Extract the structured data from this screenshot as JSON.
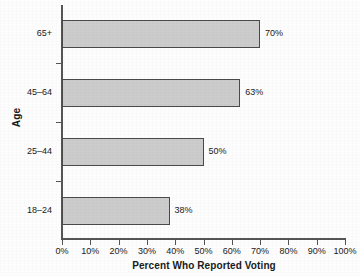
{
  "chart_data": {
    "type": "bar",
    "orientation": "horizontal",
    "title": "",
    "xlabel": "Percent Who Reported Voting",
    "ylabel": "Age",
    "categories": [
      "18–24",
      "25–44",
      "45–64",
      "65+"
    ],
    "values": [
      38,
      50,
      63,
      70
    ],
    "value_labels": [
      "38%",
      "50%",
      "63%",
      "70%"
    ],
    "xlim": [
      0,
      100
    ],
    "xticks": [
      0,
      10,
      20,
      30,
      40,
      50,
      60,
      70,
      80,
      90,
      100
    ],
    "xtick_labels": [
      "0%",
      "10%",
      "20%",
      "30%",
      "40%",
      "50%",
      "60%",
      "70%",
      "80%",
      "90%",
      "100%"
    ],
    "grid": false,
    "legend": null,
    "bar_fill_color": "#cccccc",
    "bar_edge_color": "#4a4a4a",
    "axis_color": "#555555",
    "background_color": "#fdfdfd"
  },
  "bars": [
    {
      "category": "65+",
      "value": 70,
      "label": "70%"
    },
    {
      "category": "45–64",
      "value": 63,
      "label": "63%"
    },
    {
      "category": "25–44",
      "value": 50,
      "label": "50%"
    },
    {
      "category": "18–24",
      "value": 38,
      "label": "38%"
    }
  ],
  "axes": {
    "y_title": "Age",
    "x_title": "Percent Who Reported Voting"
  }
}
